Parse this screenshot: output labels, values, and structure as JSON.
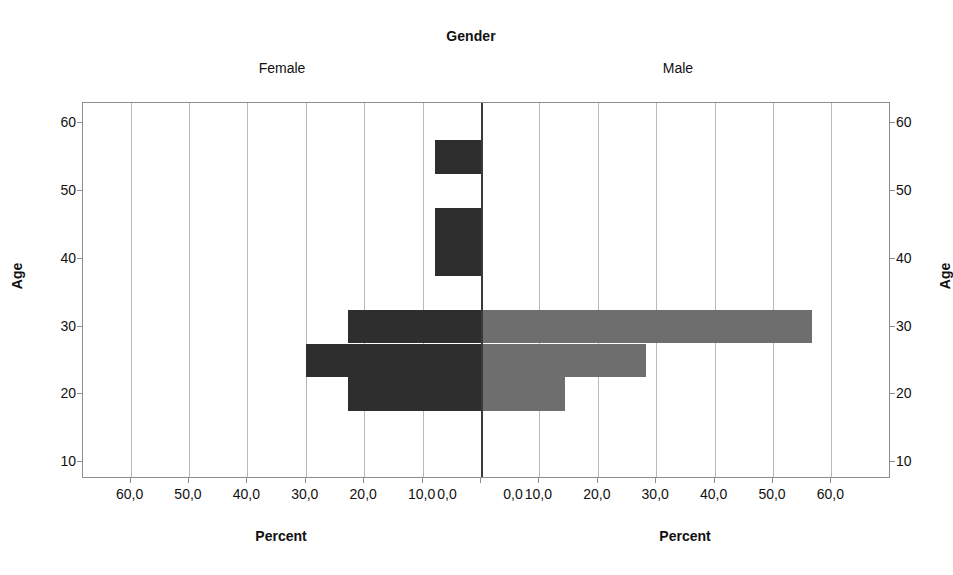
{
  "chart_data": {
    "type": "bar",
    "title": "Gender",
    "subtitle": "",
    "orientation": "horizontal",
    "layout": "population-pyramid",
    "panels": [
      {
        "name": "Female",
        "side": "left",
        "color": "#2e2e2e"
      },
      {
        "name": "Male",
        "side": "right",
        "color": "#6e6e6e"
      }
    ],
    "xlabel": "Percent",
    "ylabel": "Age",
    "xlim": [
      0,
      60
    ],
    "ylim": [
      7.5,
      63
    ],
    "grid": true,
    "legend": "none",
    "decimal_separator": ",",
    "x_tick_labels_left": [
      "60,0",
      "50,0",
      "40,0",
      "30,0",
      "20,0",
      "10,0",
      "0,0"
    ],
    "x_tick_values_left": [
      60,
      50,
      40,
      30,
      20,
      10,
      0
    ],
    "x_tick_labels_right": [
      "0,0",
      "10,0",
      "20,0",
      "30,0",
      "40,0",
      "50,0",
      "60,0"
    ],
    "x_tick_values_right": [
      0,
      10,
      20,
      30,
      40,
      50,
      60
    ],
    "y_tick_labels": [
      "60",
      "50",
      "40",
      "30",
      "20",
      "10"
    ],
    "y_tick_values": [
      60,
      50,
      40,
      30,
      20,
      10
    ],
    "bin_width": 5,
    "categories": [
      55,
      45,
      40,
      30,
      25,
      20
    ],
    "series": [
      {
        "name": "Female",
        "side": "left",
        "color": "#2e2e2e",
        "bars": [
          {
            "age": 55,
            "percent": 7.9
          },
          {
            "age": 45,
            "percent": 7.9
          },
          {
            "age": 40,
            "percent": 7.9
          },
          {
            "age": 30,
            "percent": 22.8
          },
          {
            "age": 25,
            "percent": 30.0
          },
          {
            "age": 20,
            "percent": 22.8
          }
        ]
      },
      {
        "name": "Male",
        "side": "right",
        "color": "#6e6e6e",
        "bars": [
          {
            "age": 30,
            "percent": 56.6
          },
          {
            "age": 25,
            "percent": 28.3
          },
          {
            "age": 20,
            "percent": 14.4
          }
        ]
      }
    ]
  },
  "header": {
    "title": "Gender",
    "panel_female": "Female",
    "panel_male": "Male"
  },
  "axes": {
    "x_title_left": "Percent",
    "x_title_right": "Percent",
    "y_title_left": "Age",
    "y_title_right": "Age"
  }
}
